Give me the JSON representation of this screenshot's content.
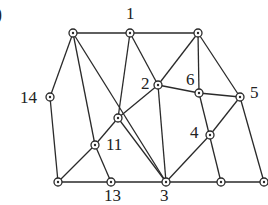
{
  "figure": {
    "corner_label": ")",
    "nodes": [
      {
        "id": "A",
        "x": 73,
        "y": 33,
        "label": ""
      },
      {
        "id": "1",
        "x": 130,
        "y": 33,
        "label": "1",
        "lx": 126,
        "ly": 19
      },
      {
        "id": "B",
        "x": 198,
        "y": 33,
        "label": ""
      },
      {
        "id": "14",
        "x": 50,
        "y": 97,
        "label": "14",
        "lx": 20,
        "ly": 103
      },
      {
        "id": "2",
        "x": 158,
        "y": 85,
        "label": "2",
        "lx": 141,
        "ly": 89
      },
      {
        "id": "6",
        "x": 199,
        "y": 93,
        "label": "6",
        "lx": 186,
        "ly": 85
      },
      {
        "id": "5",
        "x": 240,
        "y": 97,
        "label": "5",
        "lx": 250,
        "ly": 98
      },
      {
        "id": "C",
        "x": 118,
        "y": 118,
        "label": ""
      },
      {
        "id": "11",
        "x": 95,
        "y": 145,
        "label": "11",
        "lx": 106,
        "ly": 150
      },
      {
        "id": "4",
        "x": 210,
        "y": 135,
        "label": "4",
        "lx": 190,
        "ly": 138
      },
      {
        "id": "D",
        "x": 58,
        "y": 182,
        "label": ""
      },
      {
        "id": "13",
        "x": 111,
        "y": 182,
        "label": "13",
        "lx": 104,
        "ly": 201
      },
      {
        "id": "3",
        "x": 166,
        "y": 182,
        "label": "3",
        "lx": 160,
        "ly": 201
      },
      {
        "id": "E",
        "x": 221,
        "y": 182,
        "label": ""
      },
      {
        "id": "F",
        "x": 264,
        "y": 182,
        "label": ""
      }
    ],
    "edges": [
      [
        "A",
        "1"
      ],
      [
        "1",
        "B"
      ],
      [
        "A",
        "14"
      ],
      [
        "14",
        "D"
      ],
      [
        "A",
        "11"
      ],
      [
        "A",
        "3"
      ],
      [
        "1",
        "C"
      ],
      [
        "1",
        "2"
      ],
      [
        "B",
        "2"
      ],
      [
        "B",
        "6"
      ],
      [
        "B",
        "5"
      ],
      [
        "2",
        "6"
      ],
      [
        "6",
        "5"
      ],
      [
        "D",
        "11"
      ],
      [
        "11",
        "C"
      ],
      [
        "C",
        "2"
      ],
      [
        "C",
        "3"
      ],
      [
        "2",
        "3"
      ],
      [
        "11",
        "13"
      ],
      [
        "6",
        "E"
      ],
      [
        "5",
        "4"
      ],
      [
        "4",
        "3"
      ],
      [
        "5",
        "F"
      ],
      [
        "D",
        "13"
      ],
      [
        "13",
        "3"
      ],
      [
        "3",
        "E"
      ],
      [
        "E",
        "F"
      ]
    ]
  }
}
